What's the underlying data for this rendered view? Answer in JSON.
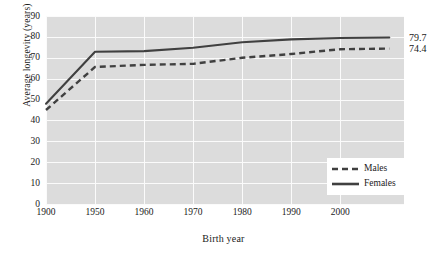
{
  "chart_data": {
    "type": "line",
    "title": "",
    "xlabel": "Birth year",
    "ylabel": "Average longevity (years)",
    "x": [
      1900,
      1950,
      1960,
      1970,
      1980,
      1990,
      2000,
      2004
    ],
    "xtick_labels": [
      "1900",
      "1950",
      "1960",
      "1970",
      "1980",
      "1990",
      "2000"
    ],
    "xticks": [
      1900,
      1950,
      1960,
      1970,
      1980,
      1990,
      2000
    ],
    "ytick_labels": [
      "0",
      "10",
      "20",
      "30",
      "40",
      "50",
      "60",
      "70",
      "80",
      "90"
    ],
    "yticks": [
      0,
      10,
      20,
      30,
      40,
      50,
      60,
      70,
      80,
      90
    ],
    "ylim": [
      0,
      90
    ],
    "grid": true,
    "legend_position": "lower right",
    "series": [
      {
        "name": "Males",
        "style": "dashed",
        "color": "#404040",
        "values": [
          45.0,
          65.6,
          66.6,
          67.1,
          70.0,
          71.8,
          74.1,
          74.4
        ],
        "end_label": "74.4"
      },
      {
        "name": "Females",
        "style": "solid",
        "color": "#404040",
        "values": [
          48.0,
          72.9,
          73.2,
          74.8,
          77.4,
          78.8,
          79.5,
          79.7
        ],
        "end_label": "79.7"
      }
    ],
    "annotations": [
      {
        "text": "79.7",
        "series": "Females",
        "at_x": 2004
      },
      {
        "text": "74.4",
        "series": "Males",
        "at_x": 2004
      }
    ],
    "colors": {
      "plot_background": "#dcdcdc",
      "gridline": "#fbfbfb",
      "line": "#404040",
      "text": "#1a1a1a",
      "legend_background": "#ffffff"
    }
  },
  "legend": {
    "items": [
      {
        "label": "Males"
      },
      {
        "label": "Females"
      }
    ]
  }
}
